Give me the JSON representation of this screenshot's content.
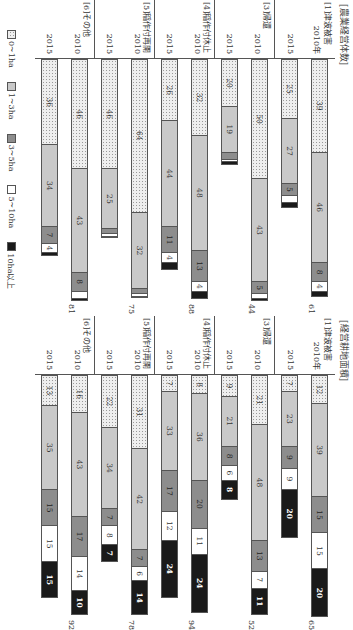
{
  "chart_data": [
    {
      "type": "bar",
      "orientation": "horizontal-stacked",
      "title": "[農業経営体数]",
      "categories": [
        "[1]津波被害 2010年",
        "[1]津波被害 2015",
        "[3]帰還 2010",
        "[3]帰還 2015",
        "[4]稲作付休止 2010",
        "[4]稲作付休止 2015",
        "[5]稲作付再開 2010",
        "[5]稲作付再開 2015",
        "[6]その他 2010",
        "[6]その他 2015"
      ],
      "series": [
        {
          "name": "0~1ha",
          "values": [
            39,
            25,
            50,
            20,
            32,
            26,
            64,
            46,
            46,
            36
          ]
        },
        {
          "name": "1~3ha",
          "values": [
            46,
            27,
            43,
            19,
            48,
            44,
            32,
            25,
            43,
            34
          ]
        },
        {
          "name": "3~5ha",
          "values": [
            8,
            5,
            5,
            3,
            13,
            11,
            2,
            2,
            8,
            7
          ]
        },
        {
          "name": "5~10ha",
          "values": [
            4,
            3,
            2,
            1,
            4,
            4,
            1,
            1,
            3,
            4
          ]
        },
        {
          "name": "10ha以上",
          "values": [
            2,
            2,
            1,
            1,
            3,
            3,
            0,
            0,
            1,
            1
          ]
        }
      ],
      "totals_2015": [
        61,
        44,
        88,
        75,
        81
      ],
      "xlabel": "",
      "ylabel": "",
      "legend_position": "bottom"
    },
    {
      "type": "bar",
      "orientation": "horizontal-stacked",
      "title": "[経営耕地面積]",
      "categories": [
        "[1]津波被害 2010年",
        "[1]津波被害 2015",
        "[3]帰還 2010",
        "[3]帰還 2015",
        "[4]稲作付休止 2010",
        "[4]稲作付休止 2015",
        "[5]稲作付再開 2010",
        "[5]稲作付再開 2015",
        "[6]その他 2010",
        "[6]その他 2015"
      ],
      "series": [
        {
          "name": "0~1ha",
          "values": [
            12,
            7,
            21,
            9,
            8,
            7,
            31,
            22,
            16,
            13
          ]
        },
        {
          "name": "1~3ha",
          "values": [
            39,
            23,
            48,
            21,
            36,
            33,
            42,
            34,
            43,
            35
          ]
        },
        {
          "name": "3~5ha",
          "values": [
            15,
            9,
            13,
            8,
            20,
            17,
            7,
            7,
            17,
            15
          ]
        },
        {
          "name": "5~10ha",
          "values": [
            15,
            9,
            7,
            6,
            11,
            12,
            6,
            8,
            14,
            15
          ]
        },
        {
          "name": "10ha以上",
          "values": [
            20,
            20,
            11,
            8,
            24,
            24,
            14,
            7,
            10,
            15
          ]
        }
      ],
      "totals_2015": [
        65,
        52,
        94,
        78,
        92
      ],
      "xlabel": "",
      "ylabel": "",
      "legend_position": "bottom"
    }
  ],
  "groups": [
    {
      "name": "[1]津波被害",
      "y1": "2010年",
      "y2": "2015"
    },
    {
      "name": "[3]帰還",
      "y1": "2010",
      "y2": "2015"
    },
    {
      "name": "[4]稲作付休止",
      "y1": "2010",
      "y2": "2015"
    },
    {
      "name": "[5]稲作付再開",
      "y1": "2010",
      "y2": "2015"
    },
    {
      "name": "[6]その他",
      "y1": "2010",
      "y2": "2015"
    }
  ],
  "panels": {
    "left_title": "[農業経営体数]",
    "right_title": "[経営耕地面積]"
  },
  "legend": [
    "0~1ha",
    "1~3ha",
    "3~5ha",
    "5~10ha",
    "10ha以上"
  ]
}
